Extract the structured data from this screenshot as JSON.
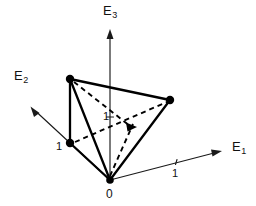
{
  "figure": {
    "type": "diagram",
    "width": 256,
    "height": 206,
    "background_color": "#ffffff",
    "line_color": "#000000"
  },
  "axes": [
    {
      "id": "e1",
      "label": "E",
      "subscript": "1",
      "label_x": 232,
      "label_y": 140,
      "from": [
        110,
        180
      ],
      "to": [
        222,
        151
      ],
      "direction": "right-slightly-up",
      "arrow": "end"
    },
    {
      "id": "e2",
      "label": "E",
      "subscript": "2",
      "label_x": 14,
      "label_y": 69,
      "from": [
        110,
        180
      ],
      "to": [
        31,
        107
      ],
      "direction": "upper-left",
      "arrow": "end"
    },
    {
      "id": "e3",
      "label": "E",
      "subscript": "3",
      "label_x": 103,
      "label_y": 4,
      "from": [
        110,
        180
      ],
      "to": [
        110,
        29
      ],
      "direction": "up",
      "arrow": "end"
    }
  ],
  "ticks": [
    {
      "id": "tick-e1",
      "value": "1",
      "label_x": 172,
      "label_y": 168,
      "mark_x": 177,
      "mark_y": 163
    },
    {
      "id": "tick-e2",
      "value": "1",
      "label_x": 56,
      "label_y": 141,
      "mark_x": 70,
      "mark_y": 143
    },
    {
      "id": "tick-e3",
      "value": "1",
      "label_x": 103,
      "label_y": 111,
      "mark_x": 110,
      "mark_y": 117
    }
  ],
  "origin": {
    "id": "origin",
    "label": "0",
    "x": 110,
    "y": 180,
    "label_x": 106,
    "label_y": 188
  },
  "vertices": [
    {
      "id": "vertex-top-left",
      "x": 70,
      "y": 79,
      "radius": 4.0
    },
    {
      "id": "vertex-right",
      "x": 170,
      "y": 100,
      "radius": 4.0
    },
    {
      "id": "vertex-left-unit",
      "x": 70,
      "y": 143,
      "radius": 4.0
    },
    {
      "id": "vertex-origin",
      "x": 110,
      "y": 180,
      "radius": 3.6
    }
  ],
  "solid_edges": [
    {
      "id": "edge-topleft-right",
      "from": [
        70,
        79
      ],
      "to": [
        170,
        100
      ]
    },
    {
      "id": "edge-topleft-leftunit",
      "from": [
        70,
        79
      ],
      "to": [
        70,
        143
      ]
    },
    {
      "id": "edge-topleft-origin",
      "from": [
        70,
        79
      ],
      "to": [
        110,
        180
      ]
    },
    {
      "id": "edge-leftunit-origin",
      "from": [
        70,
        143
      ],
      "to": [
        110,
        180
      ]
    },
    {
      "id": "edge-right-origin",
      "from": [
        170,
        100
      ],
      "to": [
        110,
        180
      ]
    }
  ],
  "dashed_edges": [
    {
      "id": "dash-topleft-center",
      "from": [
        70,
        79
      ],
      "to": [
        131,
        127
      ]
    },
    {
      "id": "dash-leftunit-right",
      "from": [
        70,
        143
      ],
      "to": [
        170,
        100
      ]
    },
    {
      "id": "dash-origin-center",
      "from": [
        110,
        180
      ],
      "to": [
        133,
        124
      ]
    },
    {
      "id": "dash-topleft-right-inner",
      "from": [
        78,
        86
      ],
      "to": [
        166,
        104
      ]
    }
  ],
  "dashed_arrow": {
    "id": "center-arrowhead",
    "tip_x": 136,
    "tip_y": 127,
    "angle_deg": 8
  }
}
